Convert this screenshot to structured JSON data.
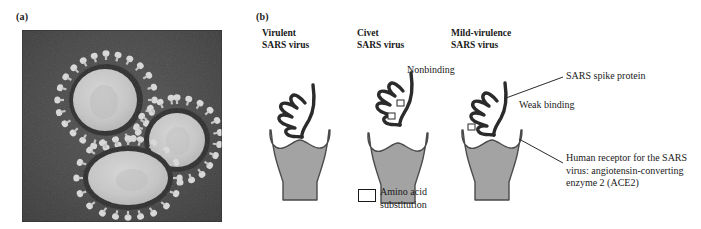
{
  "figure": {
    "type": "scientific-figure",
    "panels": [
      {
        "tag": "(a)",
        "kind": "electron-micrograph",
        "description": "Transmission electron micrograph of three coronavirus (SARS) virions showing characteristic club-shaped surface spikes forming a corona"
      },
      {
        "tag": "(b)",
        "kind": "schematic-diagram",
        "description": "Schematic of three SARS virus spike-protein variants binding to the human ACE2 receptor"
      }
    ]
  },
  "panel_a": {
    "tag": "(a)",
    "virion_count": 3,
    "background_color": "#474747",
    "core_color": "#c9c9c9",
    "spike_color": "#d5d5d5"
  },
  "panel_b": {
    "tag": "(b)",
    "variants": [
      {
        "id": "virulent",
        "title_line1": "Virulent",
        "title_line2": "SARS virus",
        "binding_state": "bound",
        "substitutions": 0
      },
      {
        "id": "civet",
        "title_line1": "Civet",
        "title_line2": "SARS virus",
        "binding_state": "nonbinding",
        "substitutions": 2
      },
      {
        "id": "mild-virulence",
        "title_line1": "Mild-virulence",
        "title_line2": "SARS virus",
        "binding_state": "weak-binding",
        "substitutions": 1
      }
    ],
    "annotations": {
      "nonbinding": "Nonbinding",
      "weak_binding": "Weak binding",
      "spike_protein": "SARS spike protein",
      "receptor": "Human receptor for the SARS virus: angiotensin-converting enzyme 2 (ACE2)"
    },
    "legend": {
      "symbol": "white-square",
      "label": "Amino acid substitution"
    },
    "colors": {
      "receptor_fill": "#a3a3a3",
      "receptor_stroke": "#4a4a4a",
      "spike_stroke": "#2b2b2b",
      "substitution_fill": "#ffffff"
    }
  }
}
